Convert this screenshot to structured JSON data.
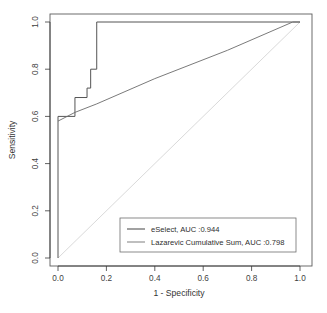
{
  "chart_data": {
    "type": "line",
    "title": "",
    "xlabel": "1 - Specificity",
    "ylabel": "Sensitivity",
    "xlim": [
      0.0,
      1.0
    ],
    "ylim": [
      0.0,
      1.0
    ],
    "grid": false,
    "legend_position": "bottom-right",
    "xticks": [
      "0.0",
      "0.2",
      "0.4",
      "0.6",
      "0.8",
      "1.0"
    ],
    "xtick_values": [
      0.0,
      0.2,
      0.4,
      0.6,
      0.8,
      1.0
    ],
    "yticks": [
      "0.0",
      "0.2",
      "0.4",
      "0.6",
      "0.8",
      "1.0"
    ],
    "ytick_values": [
      0.0,
      0.2,
      0.4,
      0.6,
      0.8,
      1.0
    ],
    "reference_diagonal": {
      "label": "chance-line",
      "x": [
        0.0,
        1.0
      ],
      "y": [
        0.0,
        1.0
      ],
      "color": "#cfcfcf"
    },
    "series": [
      {
        "name": "eSelect",
        "auc": 0.944,
        "auc_text": "0.944",
        "legend_label": "eSelect, AUC :0.944",
        "color": "#555555",
        "width": 1.0,
        "style": "step",
        "x": [
          0.0,
          0.0,
          0.07,
          0.07,
          0.12,
          0.12,
          0.135,
          0.135,
          0.16,
          0.16,
          0.97,
          1.0
        ],
        "y": [
          0.0,
          0.6,
          0.6,
          0.68,
          0.68,
          0.72,
          0.72,
          0.8,
          0.8,
          1.0,
          1.0,
          1.0
        ]
      },
      {
        "name": "Lazarevic Cumulative Sum",
        "auc": 0.798,
        "auc_text": "0.798",
        "legend_label": "Lazarevic Cumulative Sum, AUC :0.798",
        "color": "#6b6b6b",
        "width": 0.9,
        "style": "line",
        "x": [
          0.0,
          0.07,
          0.16,
          0.4,
          0.7,
          0.97,
          1.0
        ],
        "y": [
          0.58,
          0.617,
          0.653,
          0.76,
          0.88,
          1.0,
          1.0
        ]
      }
    ]
  },
  "legend": {
    "entries": [
      {
        "label": "eSelect, AUC :0.944",
        "color": "#555555"
      },
      {
        "label": "Lazarevic Cumulative Sum, AUC :0.798",
        "color": "#8a8a8a"
      }
    ]
  },
  "axes": {
    "x_title": "1 - Specificity",
    "y_title": "Sensitivity"
  }
}
